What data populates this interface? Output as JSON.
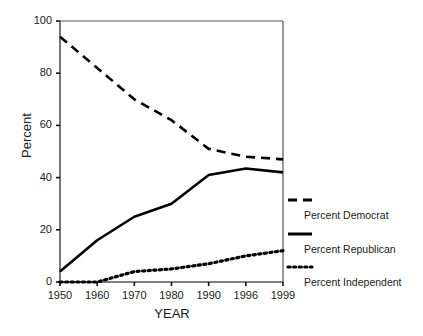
{
  "chart_data": {
    "type": "line",
    "title": "",
    "subtitle": "",
    "xlabel": "YEAR",
    "ylabel": "Percent",
    "categories": [
      "1950",
      "1960",
      "1970",
      "1980",
      "1990",
      "1996",
      "1999"
    ],
    "xticklabels": [
      "1950",
      "1960",
      "1970",
      "1980",
      "1990",
      "1996",
      "1999"
    ],
    "yticklabels": [
      "0",
      "20",
      "40",
      "60",
      "80",
      "100"
    ],
    "yticks": [
      0,
      20,
      40,
      60,
      80,
      100
    ],
    "ylim": [
      0,
      100
    ],
    "grid": false,
    "legend_position": "right",
    "series": [
      {
        "name": "Percent Democrat",
        "style": "dashed",
        "color": "#000000",
        "values": [
          94,
          82,
          70,
          62,
          51,
          48,
          47
        ]
      },
      {
        "name": "Percent Republican",
        "style": "solid",
        "color": "#000000",
        "values": [
          4,
          16,
          25,
          30,
          41,
          43.5,
          42
        ]
      },
      {
        "name": "Percent Independent",
        "style": "dotted",
        "color": "#000000",
        "values": [
          0,
          0,
          4,
          5,
          7,
          10,
          12
        ]
      }
    ]
  },
  "legend": {
    "items": [
      {
        "label": "Percent Democrat",
        "style": "dashed"
      },
      {
        "label": "Percent Republican",
        "style": "solid"
      },
      {
        "label": "Percent Independent",
        "style": "dotted"
      }
    ]
  },
  "axes": {
    "x_title": "YEAR",
    "y_title": "Percent"
  }
}
